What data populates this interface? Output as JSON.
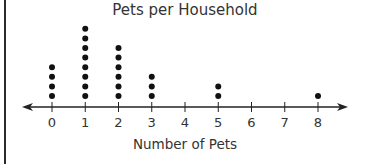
{
  "chart_data": {
    "type": "dot_plot",
    "title": "Pets per Household",
    "xlabel": "Number of Pets",
    "ylabel": "",
    "categories": [
      "0",
      "1",
      "2",
      "3",
      "4",
      "5",
      "6",
      "7",
      "8"
    ],
    "values": [
      4,
      8,
      6,
      3,
      0,
      2,
      0,
      0,
      1
    ],
    "xlim": [
      0,
      8
    ],
    "grid": false,
    "legend": null,
    "total_households": 24
  },
  "colors": {
    "dot": "#111111",
    "axis": "#222222",
    "text": "#333333"
  }
}
